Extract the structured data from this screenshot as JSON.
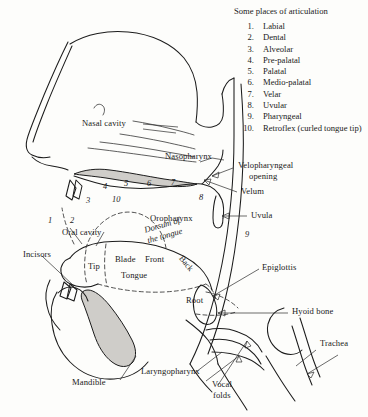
{
  "figure": {
    "type": "anatomical-diagram"
  },
  "legend": {
    "title": "Some places of articulation",
    "items": [
      {
        "index": "1.",
        "label": "Labial"
      },
      {
        "index": "2.",
        "label": "Dental"
      },
      {
        "index": "3.",
        "label": "Alveolar"
      },
      {
        "index": "4.",
        "label": "Pre-palatal"
      },
      {
        "index": "5.",
        "label": "Palatal"
      },
      {
        "index": "6.",
        "label": "Medio-palatal"
      },
      {
        "index": "7.",
        "label": "Velar"
      },
      {
        "index": "8.",
        "label": "Uvular"
      },
      {
        "index": "9.",
        "label": "Pharyngeal"
      },
      {
        "index": "10.",
        "label": "Retroflex (curled tongue tip)"
      }
    ]
  },
  "markers": [
    {
      "id": "1",
      "text": "1"
    },
    {
      "id": "2",
      "text": "2"
    },
    {
      "id": "3",
      "text": "3"
    },
    {
      "id": "4",
      "text": "4"
    },
    {
      "id": "5",
      "text": "5"
    },
    {
      "id": "6",
      "text": "6"
    },
    {
      "id": "7",
      "text": "7"
    },
    {
      "id": "8",
      "text": "8"
    },
    {
      "id": "9",
      "text": "9"
    },
    {
      "id": "10",
      "text": "10"
    }
  ],
  "labels": {
    "nasal_cavity": "Nasal cavity",
    "nasopharynx": "Nasopharynx",
    "velopharyngeal_opening_line1": "Velopharyngeal",
    "velopharyngeal_opening_line2": "opening",
    "velum": "Velum",
    "uvula": "Uvula",
    "oropharynx": "Oropharynx",
    "dorsum_line1": "Dorsum of",
    "dorsum_line2": "the tongue",
    "oral_cavity": "Oral cavity",
    "incisors": "Incisors",
    "tip": "Tip",
    "blade": "Blade",
    "front": "Front",
    "back": "Back",
    "tongue": "Tongue",
    "root": "Root",
    "epiglottis": "Epiglottis",
    "hyoid_bone": "Hyoid bone",
    "trachea": "Trachea",
    "laryngopharynx": "Laryngopharynx",
    "vocal_folds_line1": "Vocal",
    "vocal_folds_line2": "folds",
    "mandible": "Mandible"
  },
  "colors": {
    "background": "#fdfdfb",
    "ink": "#1c1c1c",
    "shading": "#cfcdc9"
  }
}
